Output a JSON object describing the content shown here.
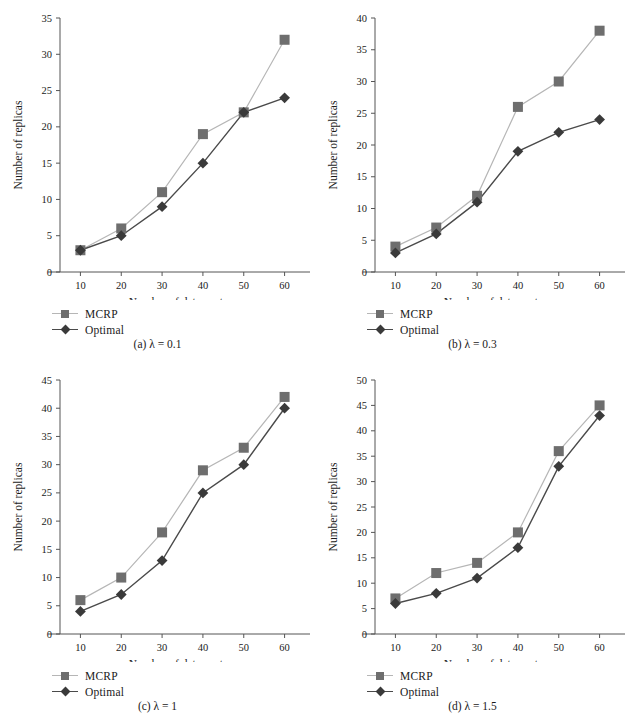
{
  "figure": {
    "panels": [
      {
        "id": "panel-a",
        "caption_index": "(a)",
        "caption_symbol": "λ",
        "caption_value": "= 0.1",
        "caption_full": "(a) λ = 0.1"
      },
      {
        "id": "panel-b",
        "caption_index": "(b)",
        "caption_symbol": "λ",
        "caption_value": "= 0.3",
        "caption_full": "(b) λ = 0.3"
      },
      {
        "id": "panel-c",
        "caption_index": "(c)",
        "caption_symbol": "λ",
        "caption_value": "= 1",
        "caption_full": "(c) λ = 1"
      },
      {
        "id": "panel-d",
        "caption_index": "(d)",
        "caption_symbol": "λ",
        "caption_value": "= 1.5",
        "caption_full": "(d) λ = 1.5"
      }
    ],
    "legend": {
      "mcrp_label": "MCRP",
      "optimal_label": "Optimal"
    },
    "colors": {
      "mcrp_marker": "#6e6e6e",
      "mcrp_line": "#b6b6b6",
      "optimal_marker": "#3a3a3a",
      "optimal_line": "#4a4a4a",
      "axis": "#555555",
      "text": "#1a1a1a"
    }
  },
  "chart_data": [
    {
      "type": "line",
      "title": "(a) λ = 0.1",
      "xlabel": "Number of data centers",
      "ylabel": "Number of replicas",
      "x": [
        10,
        20,
        30,
        40,
        50,
        60
      ],
      "xticks": [
        "10",
        "20",
        "30",
        "40",
        "50",
        "60"
      ],
      "yticks": [
        "0",
        "5",
        "10",
        "15",
        "20",
        "25",
        "30",
        "35"
      ],
      "xlim": [
        5,
        65
      ],
      "ylim": [
        0,
        35
      ],
      "grid": false,
      "legend_position": "below-left",
      "series": [
        {
          "name": "MCRP",
          "values": [
            3,
            6,
            11,
            19,
            22,
            32
          ],
          "marker": "square",
          "color": "#6e6e6e"
        },
        {
          "name": "Optimal",
          "values": [
            3,
            5,
            9,
            15,
            22,
            24
          ],
          "marker": "diamond",
          "color": "#3a3a3a"
        }
      ]
    },
    {
      "type": "line",
      "title": "(b) λ = 0.3",
      "xlabel": "Number of data centers",
      "ylabel": "Number of replicas",
      "x": [
        10,
        20,
        30,
        40,
        50,
        60
      ],
      "xticks": [
        "10",
        "20",
        "30",
        "40",
        "50",
        "60"
      ],
      "yticks": [
        "0",
        "5",
        "10",
        "15",
        "20",
        "25",
        "30",
        "35",
        "40"
      ],
      "xlim": [
        5,
        65
      ],
      "ylim": [
        0,
        40
      ],
      "grid": false,
      "legend_position": "below-left",
      "series": [
        {
          "name": "MCRP",
          "values": [
            4,
            7,
            12,
            26,
            30,
            38
          ],
          "marker": "square",
          "color": "#6e6e6e"
        },
        {
          "name": "Optimal",
          "values": [
            3,
            6,
            11,
            19,
            22,
            24
          ],
          "marker": "diamond",
          "color": "#3a3a3a"
        }
      ]
    },
    {
      "type": "line",
      "title": "(c) λ = 1",
      "xlabel": "Number of data centers",
      "ylabel": "Number of replicas",
      "x": [
        10,
        20,
        30,
        40,
        50,
        60
      ],
      "xticks": [
        "10",
        "20",
        "30",
        "40",
        "50",
        "60"
      ],
      "yticks": [
        "0",
        "5",
        "10",
        "15",
        "20",
        "25",
        "30",
        "35",
        "40",
        "45"
      ],
      "xlim": [
        5,
        65
      ],
      "ylim": [
        0,
        45
      ],
      "grid": false,
      "legend_position": "below-left",
      "series": [
        {
          "name": "MCRP",
          "values": [
            6,
            10,
            18,
            29,
            33,
            42
          ],
          "marker": "square",
          "color": "#6e6e6e"
        },
        {
          "name": "Optimal",
          "values": [
            4,
            7,
            13,
            25,
            30,
            40
          ],
          "marker": "diamond",
          "color": "#3a3a3a"
        }
      ]
    },
    {
      "type": "line",
      "title": "(d) λ = 1.5",
      "xlabel": "Number of data centers",
      "ylabel": "Number of replicas",
      "x": [
        10,
        20,
        30,
        40,
        50,
        60
      ],
      "xticks": [
        "10",
        "20",
        "30",
        "40",
        "50",
        "60"
      ],
      "yticks": [
        "0",
        "5",
        "10",
        "15",
        "20",
        "25",
        "30",
        "35",
        "40",
        "45",
        "50"
      ],
      "xlim": [
        5,
        65
      ],
      "ylim": [
        0,
        50
      ],
      "grid": false,
      "legend_position": "below-left",
      "series": [
        {
          "name": "MCRP",
          "values": [
            7,
            12,
            14,
            20,
            36,
            45
          ],
          "marker": "square",
          "color": "#6e6e6e"
        },
        {
          "name": "Optimal",
          "values": [
            6,
            8,
            11,
            17,
            33,
            43
          ],
          "marker": "diamond",
          "color": "#3a3a3a"
        }
      ]
    }
  ]
}
